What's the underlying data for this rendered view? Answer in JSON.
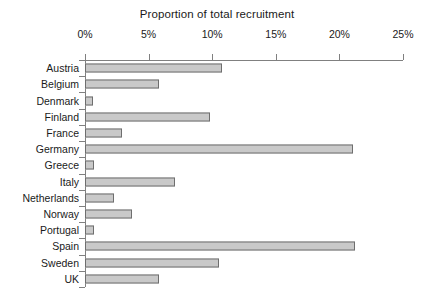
{
  "chart_data": {
    "type": "bar",
    "orientation": "horizontal",
    "title": "Proportion of total recruitment",
    "xlabel": "",
    "ylabel": "",
    "xlim": [
      0,
      25
    ],
    "xticks": [
      "0%",
      "5%",
      "10%",
      "15%",
      "20%",
      "25%"
    ],
    "xtick_values": [
      0,
      5,
      10,
      15,
      20,
      25
    ],
    "grid": false,
    "legend": null,
    "categories": [
      "Austria",
      "Belgium",
      "Denmark",
      "Finland",
      "France",
      "Germany",
      "Greece",
      "Italy",
      "Netherlands",
      "Norway",
      "Portugal",
      "Spain",
      "Sweden",
      "UK"
    ],
    "values": [
      10.8,
      5.8,
      0.6,
      9.8,
      2.9,
      21.1,
      0.7,
      7.1,
      2.3,
      3.7,
      0.7,
      21.2,
      10.5,
      5.8
    ],
    "value_unit": "%",
    "bar_fill_color": "#c9c9c9",
    "bar_edge_color": "#6e6e6e",
    "axis_color": "#808080",
    "text_color": "#1a1a1a",
    "background_color": "#ffffff"
  }
}
